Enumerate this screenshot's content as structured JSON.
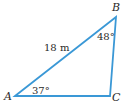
{
  "diagram": {
    "type": "right-triangle",
    "line_color": "#3a98d6",
    "text_color": "#2a2a2a",
    "vertices": {
      "A": {
        "label": "A",
        "x": 15,
        "y": 96
      },
      "B": {
        "label": "B",
        "x": 116,
        "y": 17
      },
      "C": {
        "label": "C",
        "x": 110,
        "y": 96
      }
    },
    "side_label": "18 m",
    "angles": {
      "A": "37°",
      "B": "48°"
    }
  }
}
